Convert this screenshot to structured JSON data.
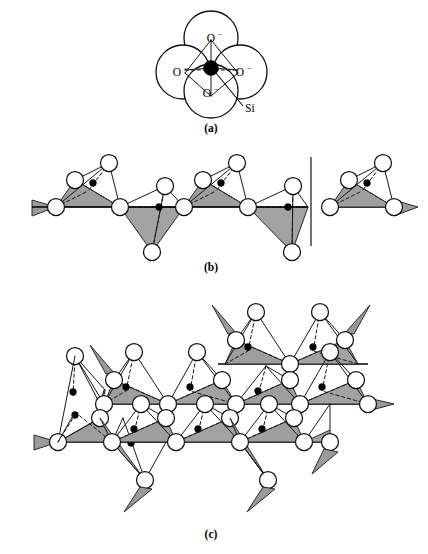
{
  "figure": {
    "background_color": "#ffffff",
    "width": 428,
    "height": 554
  },
  "style": {
    "face_fill": "#a0a0a0",
    "face_fill_dark": "#8f8f8f",
    "face_fill_light": "#b0b0b0",
    "oxygen_fill": "#ffffff",
    "oxygen_stroke": "#111111",
    "silicon_fill": "#000000",
    "line_color": "#1a1a1a"
  },
  "panels": [
    {
      "id": "a",
      "label": "(a)",
      "label_x": 211,
      "label_y": 132,
      "caption": "Single SiO4 4- tetrahedron shown as space-filling oxygen spheres with central silicon",
      "atoms": [
        {
          "name": "oxygen-top",
          "label": "O",
          "charge": "−",
          "cx": 211,
          "cy": 38,
          "r": 27,
          "label_x": 211,
          "label_y": 42
        },
        {
          "name": "oxygen-left",
          "label": "O",
          "charge": "−",
          "cx": 183,
          "cy": 72,
          "r": 27,
          "label_x": 180,
          "label_y": 76
        },
        {
          "name": "oxygen-right",
          "label": "O",
          "charge": "−",
          "cx": 240,
          "cy": 72,
          "r": 27,
          "label_x": 242,
          "label_y": 76
        },
        {
          "name": "oxygen-bottom",
          "label": "O",
          "charge": "−",
          "cx": 211,
          "cy": 91,
          "r": 27,
          "label_x": 211,
          "label_y": 95
        }
      ],
      "silicon": {
        "name": "silicon-center",
        "cx": 211,
        "cy": 68,
        "r": 7.5
      },
      "si_leader": {
        "label": "Si",
        "label_x": 245,
        "label_y": 112,
        "from_x": 216,
        "from_y": 73,
        "to_x": 243,
        "to_y": 106
      }
    },
    {
      "id": "b",
      "label": "(b)",
      "label_x": 211,
      "label_y": 271,
      "caption": "Single chain silicate structure (SiO3 2-) with corner-sharing tetrahedra"
    },
    {
      "id": "c",
      "label": "(c)",
      "label_x": 211,
      "label_y": 538,
      "caption": "Sheet silicate structure (Si2O5 2-) formed from linked double chains of tetrahedra"
    }
  ],
  "chain_b": {
    "baseline_y": 207,
    "baseline_x_start": 32,
    "baseline_x_end": 308,
    "cell_marker": {
      "x": 311,
      "y_top": 157,
      "y_bottom": 246
    },
    "unit_count": 5
  },
  "sheet_c": {
    "row_top_baseline_y": 376,
    "row_bottom_baseline_y": 442,
    "unit_count_per_row": 5
  }
}
